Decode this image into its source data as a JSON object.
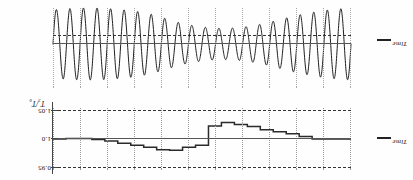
{
  "figure": {
    "orientation": "rotated-180",
    "panels": [
      {
        "name": "step-panel",
        "x_axis_label": "Time",
        "y_axis_label": "T₃/T₀"
      },
      {
        "name": "waveform-panel",
        "x_axis_label": "Time"
      }
    ]
  },
  "labels": {
    "time_step": "Time",
    "time_wave": "Time",
    "y_axis": "T₃/T₀",
    "ytick_top": "0.95",
    "ytick_mid": "1.0",
    "ytick_bot": "1.05"
  },
  "colors": {
    "trace": "#2b2b2b",
    "grid": "#9a9a9a",
    "reference": "#333333",
    "axis": "#555555",
    "background": "#ffffff"
  },
  "chart_data": [
    {
      "type": "line",
      "name": "step-panel",
      "subtype": "step",
      "title": "",
      "xlabel": "Time",
      "ylabel": "T₃/T₀",
      "ylim": [
        1.06,
        0.94
      ],
      "yticks": [
        0.95,
        1.0,
        1.05
      ],
      "reference_lines": [
        0.95,
        1.0,
        1.05
      ],
      "grid": "vertical-dotted",
      "legend": "none",
      "x": [
        0,
        1,
        2,
        3,
        4,
        5,
        6,
        7,
        8,
        9,
        10,
        11,
        12,
        13,
        14,
        15,
        16,
        17,
        18,
        19,
        20,
        21,
        22
      ],
      "values": [
        1.0,
        1.0,
        1.0,
        0.995,
        0.99,
        0.986,
        0.982,
        0.976,
        0.972,
        0.968,
        0.975,
        1.012,
        1.016,
        1.022,
        1.021,
        1.016,
        1.012,
        1.008,
        1.004,
        1.001,
        0.999,
        0.999,
        1.0
      ]
    },
    {
      "type": "line",
      "name": "waveform-panel",
      "subtype": "oscillation",
      "title": "",
      "xlabel": "Time",
      "ylabel": "",
      "ylim": [
        -1.1,
        1.1
      ],
      "grid": "vertical-dotted",
      "legend": "none",
      "description": "amplitude-modulated sinusoid, amplitude dips near the centre of the record",
      "cycles": 22,
      "amplitude_envelope": [
        1.0,
        0.97,
        0.93,
        0.86,
        0.78,
        0.68,
        0.58,
        0.5,
        0.45,
        0.43,
        0.45,
        0.5,
        0.58,
        0.7,
        0.82,
        0.9,
        0.95,
        0.98,
        1.0,
        1.0,
        0.98,
        0.95
      ]
    }
  ]
}
